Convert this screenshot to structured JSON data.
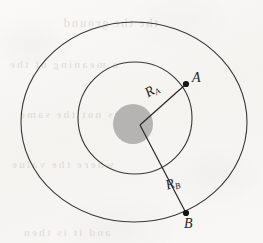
{
  "figure": {
    "name": "concentric-orbit-diagram",
    "type": "line-diagram",
    "background_color": "#f7f6f4",
    "stroke_color": "#2a2826",
    "fill_color": "#b6b4b2"
  },
  "labels": {
    "radius_a": {
      "symbol": "R",
      "subscript": "A"
    },
    "radius_b": {
      "symbol": "R",
      "subscript": "B"
    },
    "point_a": "A",
    "point_b": "B"
  },
  "bleed_through": {
    "line1": "the the ground",
    "line2": "a meaning of the",
    "line3": "is not the same",
    "line4": "where the value",
    "line5": "and it is then"
  },
  "geometry": {
    "outer_ellipse": {
      "cx": 134,
      "cy": 122,
      "rx": 113,
      "ry": 100
    },
    "inner_ellipse": {
      "cx": 135,
      "cy": 118,
      "rx": 57,
      "ry": 56
    },
    "center_disk": {
      "cx": 133,
      "cy": 124,
      "r": 20
    },
    "vertex": {
      "x": 140,
      "y": 125
    },
    "point_a": {
      "x": 186,
      "y": 84
    },
    "point_b": {
      "x": 186,
      "y": 213
    }
  }
}
